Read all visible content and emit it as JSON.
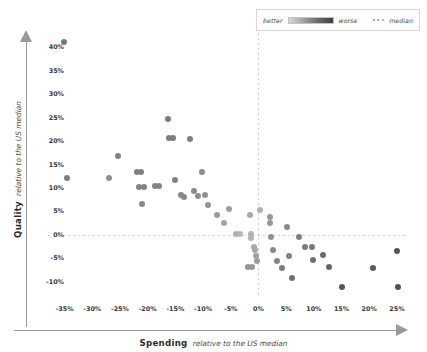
{
  "legend": {
    "better_label": "better",
    "worse_label": "worse",
    "median_label": "median",
    "ramp_from": "#d7d7d7",
    "ramp_to": "#3f3f3f",
    "median_color": "#b0b0b0"
  },
  "axis": {
    "x_title_main": "Spending",
    "x_title_sub": "relative to the US median",
    "y_title_main": "Quality",
    "y_title_sub": "relative to the US median"
  },
  "chart_data": {
    "type": "scatter",
    "title": "",
    "xlabel": "Spending relative to the US median",
    "ylabel": "Quality relative to the US median",
    "xlim": [
      -38,
      27
    ],
    "ylim": [
      -13,
      43
    ],
    "xticks": [
      "-35%",
      "-30%",
      "-25%",
      "-20%",
      "-15%",
      "-10%",
      "-5%",
      "0%",
      "5%",
      "10%",
      "15%",
      "20%",
      "25%"
    ],
    "xtick_values": [
      -35,
      -30,
      -25,
      -20,
      -15,
      -10,
      -5,
      0,
      5,
      10,
      15,
      20,
      25
    ],
    "yticks": [
      "-10%",
      "-5%",
      "0%",
      "5%",
      "10%",
      "15%",
      "20%",
      "25%",
      "30%",
      "35%",
      "40%"
    ],
    "ytick_values": [
      -10,
      -5,
      0,
      5,
      10,
      15,
      20,
      25,
      30,
      35,
      40
    ],
    "grid": false,
    "median_lines": {
      "x": 0,
      "y": 0,
      "style": "dotted",
      "color": "#cfcfcf"
    },
    "legend_position": "top-right",
    "color_encoding": {
      "meaning": "darker = worse, lighter = better relative to median",
      "light": "#d7d7d7",
      "dark": "#3f3f3f"
    },
    "points": [
      {
        "x": -35.2,
        "y": 41.0,
        "shade": 0.62
      },
      {
        "x": -34.6,
        "y": 12.2,
        "shade": 0.58
      },
      {
        "x": -25.4,
        "y": 16.8,
        "shade": 0.55
      },
      {
        "x": -22.0,
        "y": 13.3,
        "shade": 0.57
      },
      {
        "x": -21.2,
        "y": 13.3,
        "shade": 0.57
      },
      {
        "x": -21.5,
        "y": 10.2,
        "shade": 0.55
      },
      {
        "x": -20.6,
        "y": 10.2,
        "shade": 0.55
      },
      {
        "x": -21.0,
        "y": 6.6,
        "shade": 0.52
      },
      {
        "x": -18.6,
        "y": 10.4,
        "shade": 0.55
      },
      {
        "x": -18.0,
        "y": 10.4,
        "shade": 0.55
      },
      {
        "x": -16.4,
        "y": 24.6,
        "shade": 0.6
      },
      {
        "x": -16.2,
        "y": 20.6,
        "shade": 0.58
      },
      {
        "x": -15.4,
        "y": 20.6,
        "shade": 0.58
      },
      {
        "x": -15.0,
        "y": 11.8,
        "shade": 0.55
      },
      {
        "x": -13.9,
        "y": 8.6,
        "shade": 0.52
      },
      {
        "x": -13.5,
        "y": 8.0,
        "shade": 0.52
      },
      {
        "x": -12.4,
        "y": 20.5,
        "shade": 0.56
      },
      {
        "x": -11.6,
        "y": 9.4,
        "shade": 0.5
      },
      {
        "x": -11.0,
        "y": 8.3,
        "shade": 0.48
      },
      {
        "x": -10.2,
        "y": 13.4,
        "shade": 0.5
      },
      {
        "x": -9.6,
        "y": 8.6,
        "shade": 0.46
      },
      {
        "x": -9.1,
        "y": 6.3,
        "shade": 0.44
      },
      {
        "x": -7.4,
        "y": 4.3,
        "shade": 0.4
      },
      {
        "x": -6.2,
        "y": 2.6,
        "shade": 0.36
      },
      {
        "x": -5.4,
        "y": 5.6,
        "shade": 0.38
      },
      {
        "x": -4.0,
        "y": 0.3,
        "shade": 0.28
      },
      {
        "x": -1.6,
        "y": 4.2,
        "shade": 0.3
      },
      {
        "x": -1.4,
        "y": 0.2,
        "shade": 0.26
      },
      {
        "x": -1.3,
        "y": -0.6,
        "shade": 0.26
      },
      {
        "x": -0.8,
        "y": -2.6,
        "shade": 0.3
      },
      {
        "x": -0.7,
        "y": -3.3,
        "shade": 0.32
      },
      {
        "x": -0.4,
        "y": -4.4,
        "shade": 0.36
      },
      {
        "x": -0.2,
        "y": -5.6,
        "shade": 0.4
      },
      {
        "x": -1.9,
        "y": -6.9,
        "shade": 0.42
      },
      {
        "x": -1.2,
        "y": -6.9,
        "shade": 0.42
      },
      {
        "x": 2.0,
        "y": 3.8,
        "shade": 0.42
      },
      {
        "x": 2.1,
        "y": 2.6,
        "shade": 0.42
      },
      {
        "x": 2.2,
        "y": -0.4,
        "shade": 0.46
      },
      {
        "x": 2.6,
        "y": -3.3,
        "shade": 0.5
      },
      {
        "x": 3.4,
        "y": -5.6,
        "shade": 0.54
      },
      {
        "x": 4.2,
        "y": -7.1,
        "shade": 0.58
      },
      {
        "x": 5.2,
        "y": 1.6,
        "shade": 0.5
      },
      {
        "x": 5.6,
        "y": -4.4,
        "shade": 0.56
      },
      {
        "x": 6.0,
        "y": -9.2,
        "shade": 0.66
      },
      {
        "x": 7.4,
        "y": -0.5,
        "shade": 0.58
      },
      {
        "x": 8.4,
        "y": -2.6,
        "shade": 0.6
      },
      {
        "x": 9.6,
        "y": -2.6,
        "shade": 0.62
      },
      {
        "x": 9.8,
        "y": -5.4,
        "shade": 0.66
      },
      {
        "x": 11.6,
        "y": -4.2,
        "shade": 0.7
      },
      {
        "x": 12.8,
        "y": -6.8,
        "shade": 0.74
      },
      {
        "x": 15.0,
        "y": -11.0,
        "shade": 0.82
      },
      {
        "x": 20.6,
        "y": -7.0,
        "shade": 0.8
      },
      {
        "x": 25.0,
        "y": -3.4,
        "shade": 0.84
      },
      {
        "x": 25.2,
        "y": -11.1,
        "shade": 0.86
      },
      {
        "x": -27.0,
        "y": 12.2,
        "shade": 0.48
      },
      {
        "x": 0.2,
        "y": 5.3,
        "shade": 0.26
      },
      {
        "x": -3.4,
        "y": 0.3,
        "shade": 0.24
      }
    ]
  }
}
